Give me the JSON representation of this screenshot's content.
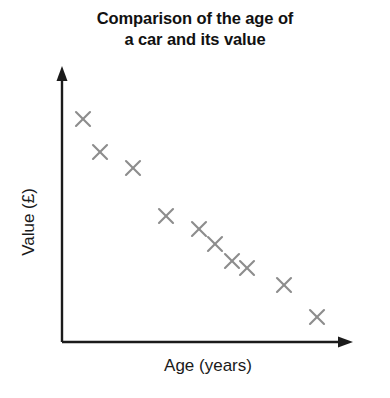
{
  "chart_data": {
    "type": "scatter",
    "title": "Comparison of the age of\na car and its value",
    "title_line1": "Comparison of the age of",
    "title_line2": "a car and its value",
    "xlabel": "Age (years)",
    "ylabel": "Value (£)",
    "grid": false,
    "legend": "none",
    "axis_ticks": "none",
    "axis_style": "arrow-headed L-shaped axes, no tick marks, no numeric scale",
    "relationship": "negative correlation — value decreases as age increases",
    "marker_symbol": "x",
    "marker_color": "#8d8d8d",
    "axis_color": "#1b1b1b",
    "xlim": [
      0,
      1
    ],
    "ylim": [
      0,
      1
    ],
    "x": [
      0.072,
      0.131,
      0.245,
      0.359,
      0.472,
      0.528,
      0.586,
      0.638,
      0.766,
      0.88
    ],
    "y": [
      0.814,
      0.693,
      0.634,
      0.458,
      0.41,
      0.355,
      0.292,
      0.266,
      0.208,
      0.092
    ],
    "points": [
      {
        "x": 0.072,
        "y": 0.814,
        "px": 83,
        "py": 119
      },
      {
        "x": 0.131,
        "y": 0.693,
        "px": 100,
        "py": 152
      },
      {
        "x": 0.245,
        "y": 0.634,
        "px": 133,
        "py": 168
      },
      {
        "x": 0.359,
        "y": 0.458,
        "px": 166,
        "py": 216
      },
      {
        "x": 0.472,
        "y": 0.41,
        "px": 199,
        "py": 229
      },
      {
        "x": 0.528,
        "y": 0.355,
        "px": 215,
        "py": 244
      },
      {
        "x": 0.586,
        "y": 0.292,
        "px": 232,
        "py": 261
      },
      {
        "x": 0.638,
        "y": 0.266,
        "px": 247,
        "py": 268
      },
      {
        "x": 0.766,
        "y": 0.208,
        "px": 284,
        "py": 285
      },
      {
        "x": 0.88,
        "y": 0.092,
        "px": 317,
        "py": 317
      }
    ],
    "point_count": 10
  },
  "geometry": {
    "origin_x": 62,
    "origin_y": 342,
    "y_axis_top": 70,
    "x_axis_right": 352,
    "marker_radius": 7
  }
}
